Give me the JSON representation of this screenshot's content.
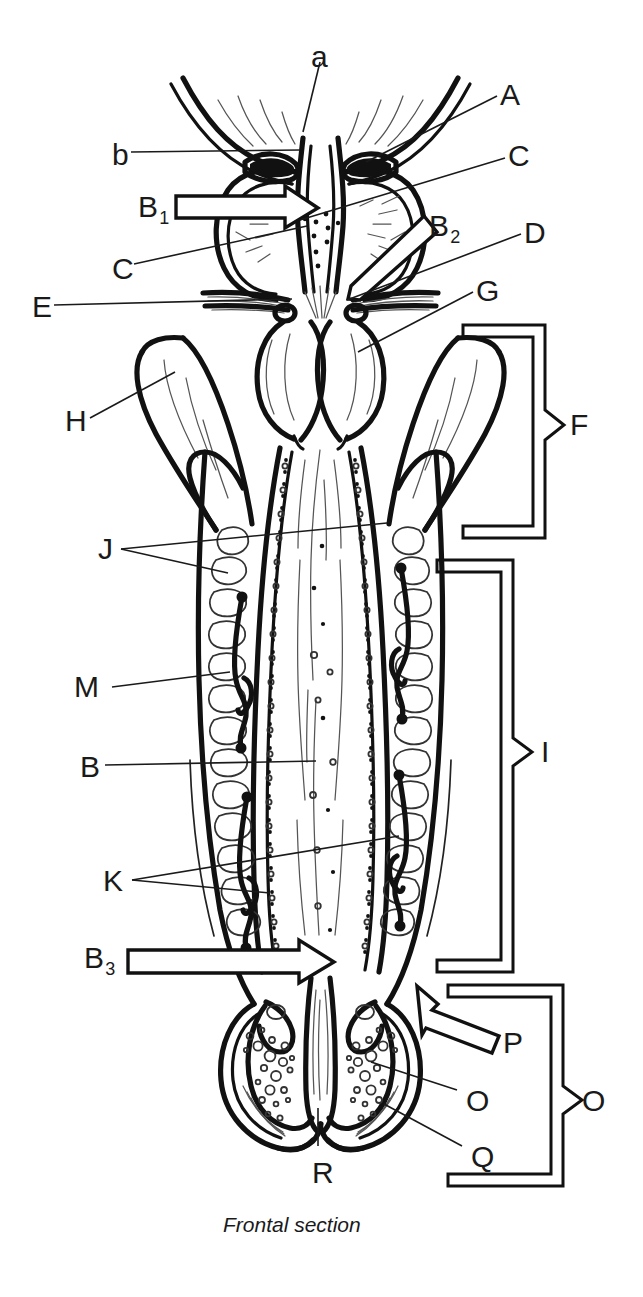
{
  "figure": {
    "caption": "Frontal section",
    "caption_position": {
      "x": 223,
      "y": 1215
    },
    "type": "anatomical-line-diagram",
    "orientation": "vertical, bilaterally symmetric",
    "ink_color": "#111111",
    "background_color": "#ffffff",
    "thin_line_color": "#444444"
  },
  "labels": [
    {
      "id": "a",
      "text": "a",
      "x": 311,
      "y": 42,
      "size": "big",
      "sub": null,
      "kind": "leader"
    },
    {
      "id": "A",
      "text": "A",
      "x": 500,
      "y": 80,
      "size": "big",
      "sub": null,
      "kind": "leader"
    },
    {
      "id": "b",
      "text": "b",
      "x": 112,
      "y": 140,
      "size": "big",
      "sub": null,
      "kind": "leader"
    },
    {
      "id": "C1",
      "text": "C",
      "x": 508,
      "y": 141,
      "size": "big",
      "sub": null,
      "kind": "leader"
    },
    {
      "id": "B1",
      "text": "B",
      "x": 138,
      "y": 192,
      "size": "big",
      "sub": "1",
      "kind": "block-arrow"
    },
    {
      "id": "B2",
      "text": "B",
      "x": 429,
      "y": 211,
      "size": "big",
      "sub": "2",
      "kind": "block-arrow"
    },
    {
      "id": "D",
      "text": "D",
      "x": 524,
      "y": 218,
      "size": "big",
      "sub": null,
      "kind": "leader"
    },
    {
      "id": "C2",
      "text": "C",
      "x": 112,
      "y": 254,
      "size": "big",
      "sub": null,
      "kind": "leader"
    },
    {
      "id": "E",
      "text": "E",
      "x": 32,
      "y": 296,
      "size": "big",
      "sub": null,
      "kind": "leader"
    },
    {
      "id": "G",
      "text": "G",
      "x": 476,
      "y": 276,
      "size": "big",
      "sub": null,
      "kind": "leader"
    },
    {
      "id": "F",
      "text": "F",
      "x": 570,
      "y": 411,
      "size": "big",
      "sub": null,
      "kind": "bracket"
    },
    {
      "id": "H",
      "text": "H",
      "x": 65,
      "y": 406,
      "size": "big",
      "sub": null,
      "kind": "leader"
    },
    {
      "id": "J",
      "text": "J",
      "x": 98,
      "y": 537,
      "size": "big",
      "sub": null,
      "kind": "leader"
    },
    {
      "id": "M",
      "text": "M",
      "x": 74,
      "y": 675,
      "size": "big",
      "sub": null,
      "kind": "leader"
    },
    {
      "id": "I",
      "text": "I",
      "x": 541,
      "y": 735,
      "size": "big",
      "sub": null,
      "kind": "bracket"
    },
    {
      "id": "B",
      "text": "B",
      "x": 80,
      "y": 755,
      "size": "big",
      "sub": null,
      "kind": "leader"
    },
    {
      "id": "K",
      "text": "K",
      "x": 103,
      "y": 868,
      "size": "big",
      "sub": null,
      "kind": "leader"
    },
    {
      "id": "B3",
      "text": "B",
      "x": 84,
      "y": 943,
      "size": "big",
      "sub": "3",
      "kind": "block-arrow"
    },
    {
      "id": "P",
      "text": "P",
      "x": 503,
      "y": 1028,
      "size": "big",
      "sub": null,
      "kind": "block-arrow"
    },
    {
      "id": "O1",
      "text": "O",
      "x": 466,
      "y": 1086,
      "size": "big",
      "sub": null,
      "kind": "leader"
    },
    {
      "id": "O2",
      "text": "O",
      "x": 582,
      "y": 1086,
      "size": "big",
      "sub": null,
      "kind": "bracket"
    },
    {
      "id": "Q",
      "text": "Q",
      "x": 471,
      "y": 1142,
      "size": "big",
      "sub": null,
      "kind": "leader"
    },
    {
      "id": "R",
      "text": "R",
      "x": 312,
      "y": 1160,
      "size": "big",
      "sub": null,
      "kind": "leader"
    }
  ],
  "brackets": [
    {
      "id": "F",
      "label": "F",
      "top": 325,
      "bottom": 538,
      "tip_y": 425,
      "x_outer": 545,
      "x_inner": 463
    },
    {
      "id": "I",
      "label": "I",
      "top": 560,
      "bottom": 972,
      "tip_y": 752,
      "x_outer": 513,
      "x_inner": 437
    },
    {
      "id": "O",
      "label": "O",
      "top": 985,
      "bottom": 1186,
      "tip_y": 1100,
      "x_outer": 563,
      "x_inner": 448
    }
  ],
  "block_arrows": [
    {
      "id": "B1",
      "from_x": 176,
      "from_y": 207,
      "to_x": 316,
      "to_y": 207,
      "direction": "right"
    },
    {
      "id": "B2",
      "from_x": 432,
      "from_y": 229,
      "to_x": 352,
      "to_y": 300,
      "direction": "down-left"
    },
    {
      "id": "B3",
      "from_x": 128,
      "from_y": 962,
      "to_x": 333,
      "to_y": 962,
      "direction": "right"
    },
    {
      "id": "P",
      "from_x": 500,
      "from_y": 1040,
      "to_x": 418,
      "to_y": 988,
      "direction": "up-left"
    }
  ],
  "leaders": [
    {
      "label": "a",
      "x1": 320,
      "y1": 62,
      "x2": 303,
      "y2": 130
    },
    {
      "label": "A",
      "x1": 497,
      "y1": 95,
      "x2": 367,
      "y2": 160
    },
    {
      "label": "b",
      "x1": 131,
      "y1": 155,
      "x2": 299,
      "y2": 150
    },
    {
      "label": "C1",
      "x1": 505,
      "y1": 157,
      "x2": 300,
      "y2": 218
    },
    {
      "label": "C2",
      "x1": 133,
      "y1": 268,
      "x2": 306,
      "y2": 224
    },
    {
      "label": "E",
      "x1": 53,
      "y1": 310,
      "x2": 290,
      "y2": 300
    },
    {
      "label": "D",
      "x1": 521,
      "y1": 233,
      "x2": 347,
      "y2": 300
    },
    {
      "label": "G",
      "x1": 473,
      "y1": 292,
      "x2": 359,
      "y2": 352
    },
    {
      "label": "H",
      "x1": 88,
      "y1": 420,
      "x2": 174,
      "y2": 372
    },
    {
      "label": "J1",
      "x1": 120,
      "y1": 552,
      "x2": 386,
      "y2": 523
    },
    {
      "label": "J2",
      "x1": 120,
      "y1": 552,
      "x2": 227,
      "y2": 573
    },
    {
      "label": "M",
      "x1": 110,
      "y1": 690,
      "x2": 227,
      "y2": 673
    },
    {
      "label": "B",
      "x1": 104,
      "y1": 768,
      "x2": 315,
      "y2": 763
    },
    {
      "label": "K1",
      "x1": 131,
      "y1": 883,
      "x2": 398,
      "y2": 838
    },
    {
      "label": "K2",
      "x1": 131,
      "y1": 883,
      "x2": 268,
      "y2": 895
    },
    {
      "label": "O1",
      "x1": 457,
      "y1": 1092,
      "x2": 371,
      "y2": 1063
    },
    {
      "label": "Q",
      "x1": 462,
      "y1": 1148,
      "x2": 383,
      "y2": 1106
    },
    {
      "label": "R",
      "x1": 318,
      "y1": 1148,
      "x2": 318,
      "y2": 1110
    }
  ]
}
